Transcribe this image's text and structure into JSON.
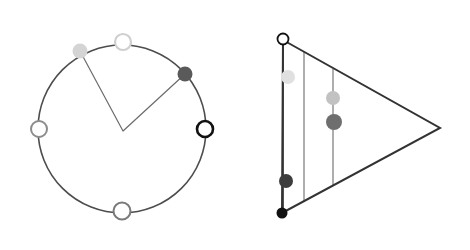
{
  "figure": {
    "title": "",
    "background": "#ffffff",
    "width": 470,
    "height": 250,
    "panels": [
      {
        "name": "circle-panel",
        "label": "",
        "shape": "circle",
        "center": {
          "x": 122,
          "y": 129
        },
        "radius": 84,
        "stroke": "#4d4d4d",
        "stroke_width": 1.6,
        "chevron": {
          "name": "chevron-path",
          "apex": {
            "x": 123,
            "y": 131
          },
          "left_end": {
            "x": 80,
            "y": 51
          },
          "right_end": {
            "x": 185,
            "y": 74
          },
          "stroke": "#6b6b6b",
          "stroke_width": 1.2
        },
        "nodes": [
          {
            "name": "node-top-white",
            "label": "",
            "x": 123,
            "y": 42,
            "r": 8,
            "fill": "#ffffff",
            "stroke": "#cfcfcf",
            "stroke_width": 2.2,
            "style": "open"
          },
          {
            "name": "node-upper-left-light",
            "label": "",
            "x": 80,
            "y": 51,
            "r": 7.5,
            "fill": "#d4d4d4",
            "stroke": "#d4d4d4",
            "stroke_width": 0,
            "style": "filled"
          },
          {
            "name": "node-upper-right-dark",
            "label": "",
            "x": 185,
            "y": 74,
            "r": 7.5,
            "fill": "#5a5a5a",
            "stroke": "#5a5a5a",
            "stroke_width": 0,
            "style": "filled"
          },
          {
            "name": "node-right-black-ring",
            "label": "",
            "x": 205,
            "y": 129,
            "r": 8,
            "fill": "#ffffff",
            "stroke": "#111111",
            "stroke_width": 2.6,
            "style": "open"
          },
          {
            "name": "node-left-gray-ring",
            "label": "",
            "x": 39,
            "y": 129,
            "r": 8,
            "fill": "#ffffff",
            "stroke": "#8c8c8c",
            "stroke_width": 2.0,
            "style": "open"
          },
          {
            "name": "node-bottom-gray-ring",
            "label": "",
            "x": 122,
            "y": 211,
            "r": 8.5,
            "fill": "#ffffff",
            "stroke": "#7a7a7a",
            "stroke_width": 2.0,
            "style": "open"
          }
        ]
      },
      {
        "name": "triangle-panel",
        "label": "",
        "shape": "triangle",
        "vertices": {
          "top_left": {
            "x": 283,
            "y": 40
          },
          "bottom_left": {
            "x": 282,
            "y": 213
          },
          "right_apex": {
            "x": 440,
            "y": 128
          }
        },
        "stroke": "#333333",
        "stroke_width": 2.0,
        "verticals": [
          {
            "name": "vertical-line-1",
            "x": 283,
            "y_top": 40,
            "y_bottom": 213,
            "stroke": "#555555",
            "stroke_width": 2.0
          },
          {
            "name": "vertical-line-2",
            "x": 304,
            "y_top": 52,
            "y_bottom": 202,
            "stroke": "#8c8c8c",
            "stroke_width": 1.4
          },
          {
            "name": "vertical-line-3",
            "x": 333,
            "y_top": 69,
            "y_bottom": 186,
            "stroke": "#8c8c8c",
            "stroke_width": 1.4
          }
        ],
        "nodes": [
          {
            "name": "node-top-left-vertex-open",
            "label": "",
            "x": 283,
            "y": 39,
            "r": 5.5,
            "fill": "#ffffff",
            "stroke": "#111111",
            "stroke_width": 1.8,
            "style": "open"
          },
          {
            "name": "node-bottom-left-vertex-black",
            "label": "",
            "x": 282,
            "y": 213,
            "r": 5.5,
            "fill": "#111111",
            "stroke": "#111111",
            "stroke_width": 0,
            "style": "filled"
          },
          {
            "name": "node-col1-light",
            "label": "",
            "x": 288,
            "y": 77,
            "r": 7.0,
            "fill": "#e0e0e0",
            "stroke": "#e0e0e0",
            "stroke_width": 0,
            "style": "filled"
          },
          {
            "name": "node-col1-dark",
            "label": "",
            "x": 286,
            "y": 181,
            "r": 7.0,
            "fill": "#3d3d3d",
            "stroke": "#3d3d3d",
            "stroke_width": 0,
            "style": "filled"
          },
          {
            "name": "node-col3-light",
            "label": "",
            "x": 333,
            "y": 98,
            "r": 7.0,
            "fill": "#c2c2c2",
            "stroke": "#c2c2c2",
            "stroke_width": 0,
            "style": "filled"
          },
          {
            "name": "node-col3-dark",
            "label": "",
            "x": 334,
            "y": 122,
            "r": 8.0,
            "fill": "#6e6e6e",
            "stroke": "#6e6e6e",
            "stroke_width": 0,
            "style": "filled"
          }
        ]
      }
    ]
  }
}
